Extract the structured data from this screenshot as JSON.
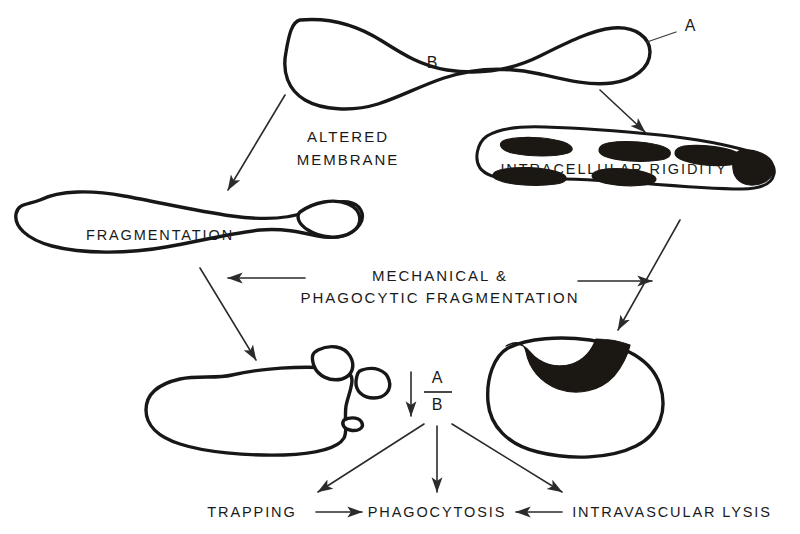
{
  "figure": {
    "background_color": "#ffffff",
    "ink_color": "#171717"
  },
  "labels": {
    "membrane_letter": "A",
    "interior_letter": "B",
    "altered_membrane_line1": "ALTERED",
    "altered_membrane_line2": "MEMBRANE",
    "intracellular_rigidity": "INTRACELLULAR RIGIDITY",
    "fragmentation": "FRAGMENTATION",
    "mechanical_line1": "MECHANICAL &",
    "mechanical_line2": "PHAGOCYTIC FRAGMENTATION",
    "ratio_numerator": "A",
    "ratio_denominator": "B",
    "trapping": "TRAPPING",
    "phagocytosis": "PHAGOCYTOSIS",
    "intravascular_lysis": "INTRAVASCULAR LYSIS"
  },
  "cells": [
    {
      "name": "normal-biconcave-cell",
      "description": "dumbbell / bone-shaped normal cell at top with membrane A and interior B"
    },
    {
      "name": "fragmented-cell",
      "description": "elongated cell on left pinching off a bud, labelled FRAGMENTATION"
    },
    {
      "name": "rigid-cell",
      "description": "elongated cell on right with dark intracellular inclusions, labelled INTRACELLULAR RIGIDITY"
    },
    {
      "name": "budding-cell",
      "description": "rounded cell lower left with attached bud, detached free fragment and tail spicule"
    },
    {
      "name": "cup-cell",
      "description": "rounded cell lower right with thick dark crescent of rigid material at top rim"
    }
  ],
  "arrows": [
    {
      "name": "arrow-normal-to-fragmented",
      "direction": "down-left"
    },
    {
      "name": "arrow-normal-to-rigid",
      "direction": "down-right"
    },
    {
      "name": "arrow-center-to-fragmented",
      "direction": "left"
    },
    {
      "name": "arrow-center-to-rigid",
      "direction": "right"
    },
    {
      "name": "arrow-fragmented-to-budding",
      "direction": "down-right"
    },
    {
      "name": "arrow-rigid-to-cup",
      "direction": "down-left"
    },
    {
      "name": "arrow-ratio-decrease",
      "direction": "down"
    },
    {
      "name": "arrow-ratio-to-trapping",
      "direction": "down-left"
    },
    {
      "name": "arrow-ratio-to-phagocytosis",
      "direction": "down"
    },
    {
      "name": "arrow-ratio-to-lysis",
      "direction": "down-right"
    },
    {
      "name": "arrow-trapping-to-phagocytosis",
      "direction": "right"
    },
    {
      "name": "arrow-lysis-to-phagocytosis",
      "direction": "left"
    }
  ]
}
